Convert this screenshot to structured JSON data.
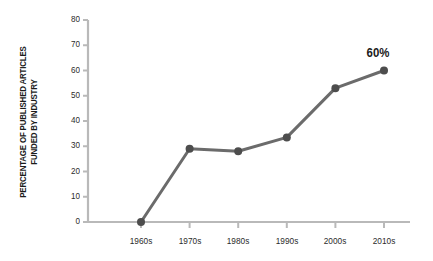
{
  "chart_data": {
    "type": "line",
    "title": "",
    "subtitle": "",
    "xlabel": "",
    "ylabel": "PERCENTAGE OF PUBLISHED ARTICLES FUNDED BY INDUSTRY",
    "ylabel_lines": [
      "PERCENTAGE OF PUBLISHED ARTICLES",
      "FUNDED BY INDUSTRY"
    ],
    "categories": [
      "1960s",
      "1970s",
      "1980s",
      "1990s",
      "2000s",
      "2010s"
    ],
    "values": [
      0,
      29,
      28,
      33.5,
      53,
      60
    ],
    "series": [
      {
        "name": "Percentage of published articles funded by industry",
        "values": [
          0,
          29,
          28,
          33.5,
          53,
          60
        ]
      }
    ],
    "ylim": [
      0,
      80
    ],
    "yticks": [
      0,
      10,
      20,
      30,
      40,
      50,
      60,
      70,
      80
    ],
    "ytick_labels": [
      "0",
      "10",
      "20",
      "30",
      "40",
      "50",
      "60",
      "70",
      "80"
    ],
    "xtick_labels": [
      "1960s",
      "1970s",
      "1980s",
      "1990s",
      "2000s",
      "2010s"
    ],
    "grid": false,
    "legend": "none",
    "annotations": [
      {
        "text": "60%",
        "category": "2010s",
        "value": 60
      }
    ],
    "colors": {
      "line": "#6b6b6b",
      "marker": "#4d4d4d",
      "axis": "#b9b9b9",
      "tick_text": "#2b2b2b",
      "label_text": "#1c1c1c",
      "annotation": "#1a1a1a",
      "background": "#ffffff"
    },
    "line_width": 3,
    "marker_size": 4,
    "marker_shape": "circle"
  }
}
